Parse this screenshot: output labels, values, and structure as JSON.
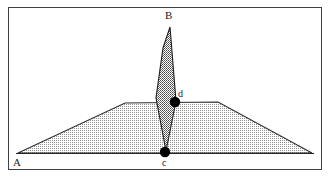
{
  "figure": {
    "background_color": "#ffffff",
    "border": {
      "name": "outer-frame",
      "stroke_color": "#3c3c3c",
      "x": 8,
      "y": 7,
      "width": 314,
      "height": 163
    },
    "baseline": {
      "name": "base-line-A-to-right",
      "stroke_color": "#2a2a2a",
      "x1": 18,
      "y1": 153,
      "x2": 313,
      "y2": 153
    },
    "shapes": [
      {
        "id": "base-polygon",
        "label": "wide shallow trapezoid",
        "fill_style": "light-dither-hatch",
        "fill_color": "#b8b8b8",
        "stroke_color": "#2a2a2a",
        "points": "18,153 125,103 218,102 312,153"
      },
      {
        "id": "spike-polygon",
        "label": "tall narrow spike B to c",
        "fill_style": "dark-dither-hatch",
        "fill_color": "#7d7d7d",
        "stroke_color": "#1e1e1e",
        "points": "170,27 176,101 166,151 156,98 163,48"
      }
    ],
    "points": [
      {
        "id": "point-d",
        "label": "d",
        "cx": 175,
        "cy": 102,
        "r": 5,
        "color": "#000000",
        "label_x": 178,
        "label_y": 89
      },
      {
        "id": "point-c",
        "label": "c",
        "cx": 165,
        "cy": 152,
        "r": 5,
        "color": "#000000",
        "label_x": 162,
        "label_y": 158
      }
    ],
    "labels": [
      {
        "id": "label-B",
        "text": "B",
        "x": 165,
        "y": 10
      },
      {
        "id": "label-A",
        "text": "A",
        "x": 13,
        "y": 157
      }
    ]
  }
}
